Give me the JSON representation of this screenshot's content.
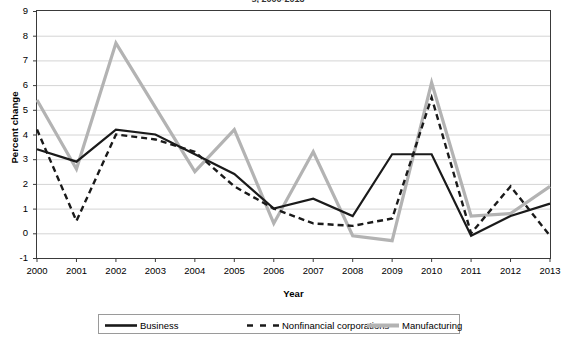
{
  "chart_data": {
    "type": "line",
    "title": "s, 2000-2013",
    "xlabel": "Year",
    "ylabel": "Percent change",
    "categories": [
      "2000",
      "2001",
      "2002",
      "2003",
      "2004",
      "2005",
      "2006",
      "2007",
      "2008",
      "2009",
      "2010",
      "2011",
      "2012",
      "2013"
    ],
    "x": [
      2000,
      2001,
      2002,
      2003,
      2004,
      2005,
      2006,
      2007,
      2008,
      2009,
      2010,
      2011,
      2012,
      2013
    ],
    "ylim": [
      -1,
      9
    ],
    "xlim": [
      2000,
      2013
    ],
    "yticks": [
      "9",
      "8",
      "7",
      "6",
      "5",
      "4",
      "3",
      "2",
      "1",
      "0",
      "-1"
    ],
    "ytick_values": [
      9,
      8,
      7,
      6,
      5,
      4,
      3,
      2,
      1,
      0,
      -1
    ],
    "grid": "horizontal",
    "legend_position": "bottom",
    "series": [
      {
        "name": "Business",
        "color": "#1a1a1a",
        "style": "solid",
        "values": [
          3.4,
          2.9,
          4.2,
          4.0,
          3.2,
          2.4,
          1.0,
          1.4,
          0.7,
          3.2,
          3.2,
          -0.1,
          0.7,
          1.2
        ]
      },
      {
        "name": "Nonfinancial corporations",
        "color": "#1a1a1a",
        "style": "dashed",
        "values": [
          4.2,
          0.5,
          4.0,
          3.8,
          3.3,
          1.9,
          1.0,
          0.4,
          0.3,
          0.6,
          5.5,
          0.0,
          1.9,
          -0.1
        ]
      },
      {
        "name": "Manufacturing",
        "color": "#b3b3b3",
        "style": "solid",
        "values": [
          5.4,
          2.6,
          7.7,
          5.1,
          2.5,
          4.2,
          0.4,
          3.3,
          -0.1,
          -0.3,
          6.1,
          0.7,
          0.8,
          1.9
        ]
      }
    ]
  },
  "legend": {
    "items": [
      {
        "label": "Business"
      },
      {
        "label": "Nonfinancial corporations"
      },
      {
        "label": "Manufacturing"
      }
    ]
  }
}
